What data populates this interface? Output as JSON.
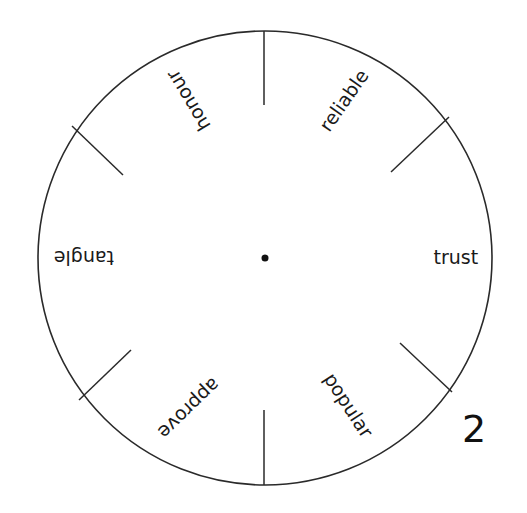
{
  "wheel": {
    "center": {
      "x": 265,
      "y": 258
    },
    "radius": 227,
    "stroke_color": "#2a2a2a",
    "center_dot_radius": 3.5,
    "dividers": [
      {
        "x1": 264,
        "y1": 31,
        "x2": 264,
        "y2": 105
      },
      {
        "x1": 72,
        "y1": 126,
        "x2": 123,
        "y2": 175
      },
      {
        "x1": 449,
        "y1": 117,
        "x2": 391,
        "y2": 172
      },
      {
        "x1": 79,
        "y1": 400,
        "x2": 131,
        "y2": 350
      },
      {
        "x1": 452,
        "y1": 392,
        "x2": 400,
        "y2": 343
      },
      {
        "x1": 264,
        "y1": 410,
        "x2": 264,
        "y2": 485
      }
    ],
    "labels": [
      {
        "text": "honour",
        "cx": 188,
        "cy": 100,
        "angle": -121
      },
      {
        "text": "reliable",
        "cx": 344,
        "cy": 100,
        "angle": -55
      },
      {
        "text": "trust",
        "cx": 456,
        "cy": 257,
        "angle": 0
      },
      {
        "text": "popular",
        "cx": 348,
        "cy": 405,
        "angle": 57
      },
      {
        "text": "approve",
        "cx": 189,
        "cy": 408,
        "angle": 136
      },
      {
        "text": "tangle",
        "cx": 84,
        "cy": 257,
        "angle": 180
      }
    ]
  },
  "page_number": "2"
}
